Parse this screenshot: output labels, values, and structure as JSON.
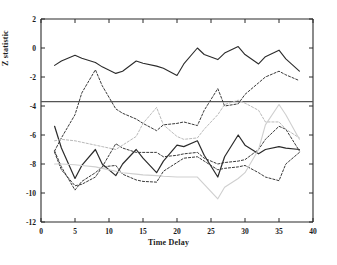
{
  "chart_data": {
    "type": "line",
    "title": "",
    "xlabel": "Time Delay",
    "ylabel": "Z statistic",
    "xlim": [
      0,
      40
    ],
    "ylim": [
      -12,
      2
    ],
    "xticks": [
      0,
      5,
      10,
      15,
      20,
      25,
      30,
      35,
      40
    ],
    "xticklabels": [
      "0",
      "5",
      "10",
      "15",
      "20",
      "25",
      "30",
      "35",
      "40"
    ],
    "yticks": [
      2,
      0,
      -2,
      -4,
      -6,
      -8,
      -10,
      -12
    ],
    "yticklabels": [
      "2",
      "0",
      "-2",
      "-4",
      "-6",
      "-8",
      "-10",
      "-12"
    ],
    "grid": false,
    "legend": "none",
    "annotations": [
      {
        "kind": "hline",
        "name": "significance-threshold",
        "y": -3.7,
        "style": "solid",
        "color": "#555555"
      }
    ],
    "x": [
      2,
      3,
      5,
      6,
      8,
      9,
      11,
      12,
      14,
      15,
      17,
      18,
      20,
      21,
      23,
      24,
      26,
      27,
      29,
      30,
      32,
      33,
      35,
      36,
      38
    ],
    "series": [
      {
        "name": "series-1-upper-solid",
        "style": "solid",
        "color": "#2b2b2b",
        "width": 1.1,
        "values": [
          -1.2,
          -0.9,
          -0.5,
          -0.7,
          -1.0,
          -1.3,
          -1.75,
          -1.6,
          -0.9,
          -1.05,
          -1.25,
          -1.4,
          -1.9,
          -1.1,
          0.0,
          -0.45,
          -0.8,
          -0.35,
          0.1,
          -0.45,
          -1.1,
          -0.6,
          -0.15,
          -0.75,
          -1.6
        ]
      },
      {
        "name": "series-2-upper-dashed",
        "style": "dashed",
        "color": "#3a3a3a",
        "width": 1.0,
        "values": [
          -7.1,
          -6.2,
          -4.6,
          -3.1,
          -1.5,
          -2.6,
          -4.2,
          -4.5,
          -4.9,
          -5.2,
          -5.7,
          -5.3,
          -5.2,
          -5.1,
          -5.35,
          -4.3,
          -2.8,
          -4.0,
          -3.85,
          -3.2,
          -2.4,
          -2.0,
          -1.6,
          -1.85,
          -2.25
        ]
      },
      {
        "name": "series-3-lower-solid",
        "style": "solid",
        "color": "#2b2b2b",
        "width": 1.2,
        "values": [
          -5.4,
          -6.9,
          -9.0,
          -8.1,
          -7.0,
          -8.0,
          -8.8,
          -8.0,
          -7.0,
          -7.6,
          -8.6,
          -7.8,
          -6.7,
          -6.8,
          -6.4,
          -7.4,
          -8.9,
          -7.5,
          -6.0,
          -6.7,
          -7.3,
          -7.0,
          -6.8,
          -6.9,
          -7.0
        ]
      },
      {
        "name": "series-4-lower-dashed-a",
        "style": "dashed",
        "color": "#3a3a3a",
        "width": 1.0,
        "values": [
          -7.1,
          -8.2,
          -9.8,
          -9.2,
          -8.6,
          -8.2,
          -6.6,
          -6.9,
          -7.2,
          -7.2,
          -7.2,
          -7.5,
          -7.4,
          -7.3,
          -7.2,
          -7.6,
          -8.0,
          -7.9,
          -7.8,
          -7.7,
          -7.0,
          -6.3,
          -5.4,
          -5.6,
          -7.1
        ]
      },
      {
        "name": "series-5-lower-dashed-b",
        "style": "dashed",
        "color": "#3a3a3a",
        "width": 1.0,
        "values": [
          -7.2,
          -8.4,
          -9.5,
          -9.4,
          -8.9,
          -8.2,
          -8.1,
          -8.7,
          -9.1,
          -9.2,
          -9.25,
          -8.5,
          -7.9,
          -7.6,
          -7.5,
          -7.8,
          -8.4,
          -8.3,
          -8.2,
          -8.1,
          -8.6,
          -8.9,
          -9.15,
          -8.0,
          -7.2
        ]
      },
      {
        "name": "series-6-gray-dashed-a",
        "style": "dashed",
        "color": "#b9b9b9",
        "width": 1.0,
        "values": [
          -6.4,
          -6.3,
          -6.4,
          -6.5,
          -6.7,
          -6.8,
          -7.0,
          -6.7,
          -6.1,
          -5.2,
          -4.1,
          -5.3,
          -6.1,
          -6.3,
          -6.2,
          -5.6,
          -4.6,
          -3.9,
          -3.6,
          -3.8,
          -4.3,
          -5.1,
          -5.1,
          -5.6,
          -6.2
        ]
      },
      {
        "name": "series-7-gray-solid",
        "style": "solid",
        "color": "#cfcfcf",
        "width": 1.1,
        "values": [
          -8.0,
          -8.0,
          -8.05,
          -8.1,
          -8.2,
          -8.3,
          -8.5,
          -8.6,
          -8.7,
          -8.75,
          -8.8,
          -8.85,
          -8.9,
          -8.9,
          -8.9,
          -9.4,
          -10.4,
          -9.6,
          -9.0,
          -8.6,
          -7.0,
          -5.3,
          -3.9,
          -4.6,
          -6.3
        ]
      }
    ]
  }
}
